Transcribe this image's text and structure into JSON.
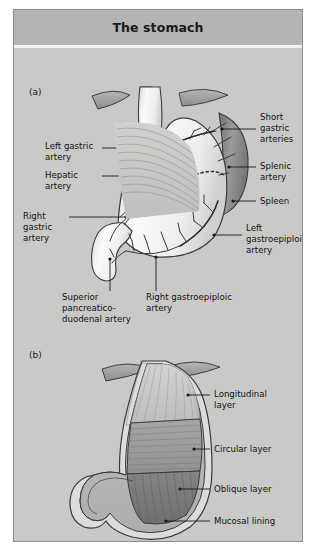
{
  "figure": {
    "title": "The stomach",
    "panels": [
      {
        "tag": "(a)",
        "name": "arterial-supply-panel"
      },
      {
        "tag": "(b)",
        "name": "muscle-layers-panel"
      }
    ]
  },
  "panel_a": {
    "labels": [
      {
        "id": "left-gastric-artery",
        "text": "Left gastric\nartery"
      },
      {
        "id": "hepatic-artery",
        "text": "Hepatic\nartery"
      },
      {
        "id": "right-gastric-artery",
        "text": "Right\ngastric\nartery"
      },
      {
        "id": "superior-pancreaticoduodenal-artery",
        "text": "Superior\npancreatico-\nduodenal artery"
      },
      {
        "id": "right-gastroepiploic-artery",
        "text": "Right gastroepiploic\nartery"
      },
      {
        "id": "short-gastric-arteries",
        "text": "Short\ngastric\narteries"
      },
      {
        "id": "splenic-artery",
        "text": "Splenic\nartery"
      },
      {
        "id": "spleen",
        "text": "Spleen"
      },
      {
        "id": "left-gastroepiploic-artery",
        "text": "Left\ngastroepiploic\nartery"
      }
    ]
  },
  "panel_b": {
    "labels": [
      {
        "id": "longitudinal-layer",
        "text": "Longitudinal\nlayer"
      },
      {
        "id": "circular-layer",
        "text": "Circular layer"
      },
      {
        "id": "oblique-layer",
        "text": "Oblique layer"
      },
      {
        "id": "mucosal-lining",
        "text": "Mucosal lining"
      }
    ]
  },
  "colors": {
    "frame_background": "#c9c9c7",
    "title_background": "#b4b4b4",
    "organ_light": "#f2f2f0",
    "spleen": "#8a8a8a",
    "muscle_mid": "#9c9c9a",
    "muscle_dark": "#7e7e7c",
    "outline": "#3a3a3a",
    "text": "#111111"
  }
}
